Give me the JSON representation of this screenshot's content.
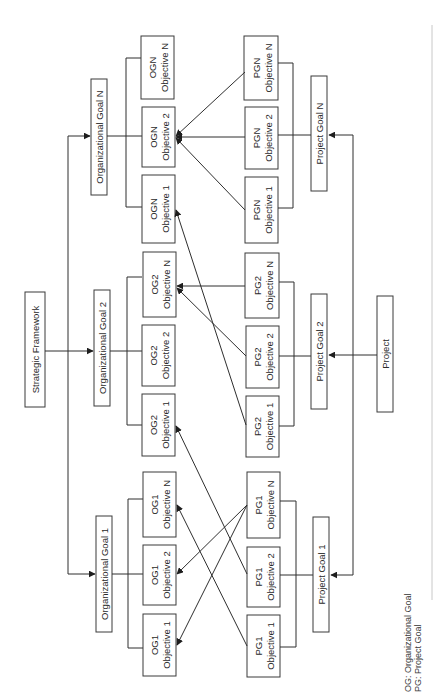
{
  "diagram": {
    "root": {
      "label": "Strategic Framework"
    },
    "organizational_goals": [
      {
        "label": "Organizational Goal 1",
        "objectives": [
          {
            "line1": "OG1",
            "line2": "Objective 1"
          },
          {
            "line1": "OG1",
            "line2": "Objective 2"
          },
          {
            "line1": "OG1",
            "line2": "Objective N"
          }
        ]
      },
      {
        "label": "Organizational Goal 2",
        "objectives": [
          {
            "line1": "OG2",
            "line2": "Objective 1"
          },
          {
            "line1": "OG2",
            "line2": "Objective 2"
          },
          {
            "line1": "OG2",
            "line2": "Objective N"
          }
        ]
      },
      {
        "label": "Organizational Goal N",
        "objectives": [
          {
            "line1": "OGN",
            "line2": "Objective 1"
          },
          {
            "line1": "OGN",
            "line2": "Objective 2"
          },
          {
            "line1": "OGN",
            "line2": "Objective N"
          }
        ]
      }
    ],
    "project": {
      "label": "Project"
    },
    "project_goals": [
      {
        "label": "Project Goal 1",
        "objectives": [
          {
            "line1": "PG1",
            "line2": "Objective 1"
          },
          {
            "line1": "PG1",
            "line2": "Objective 2"
          },
          {
            "line1": "PG1",
            "line2": "Objective N"
          }
        ]
      },
      {
        "label": "Project Goal 2",
        "objectives": [
          {
            "line1": "PG2",
            "line2": "Objective 1"
          },
          {
            "line1": "PG2",
            "line2": "Objective 2"
          },
          {
            "line1": "PG2",
            "line2": "Objective N"
          }
        ]
      },
      {
        "label": "Project Goal N",
        "objectives": [
          {
            "line1": "PGN",
            "line2": "Objective 1"
          },
          {
            "line1": "PGN",
            "line2": "Objective 2"
          },
          {
            "line1": "PGN",
            "line2": "Objective N"
          }
        ]
      }
    ],
    "alignments": [
      {
        "from": "PG1 Objective 1",
        "to": "OG1 Objective N"
      },
      {
        "from": "PG1 Objective 2",
        "to": "OG2 Objective 1"
      },
      {
        "from": "PG1 Objective N",
        "to": "OG1 Objective 2"
      },
      {
        "from": "PG1 Objective N",
        "to": "OG1 Objective 1"
      },
      {
        "from": "PG2 Objective 1",
        "to": "OGN Objective 1"
      },
      {
        "from": "PG2 Objective 2",
        "to": "OG2 Objective N"
      },
      {
        "from": "PG2 Objective N",
        "to": "OG2 Objective N"
      },
      {
        "from": "PGN Objective 1",
        "to": "OGN Objective 2"
      },
      {
        "from": "PGN Objective 2",
        "to": "OGN Objective 2"
      },
      {
        "from": "PGN Objective N",
        "to": "OGN Objective 2"
      }
    ],
    "legend": {
      "og": "OG: Organizational Goal",
      "pg": "PG: Project Goal"
    }
  }
}
